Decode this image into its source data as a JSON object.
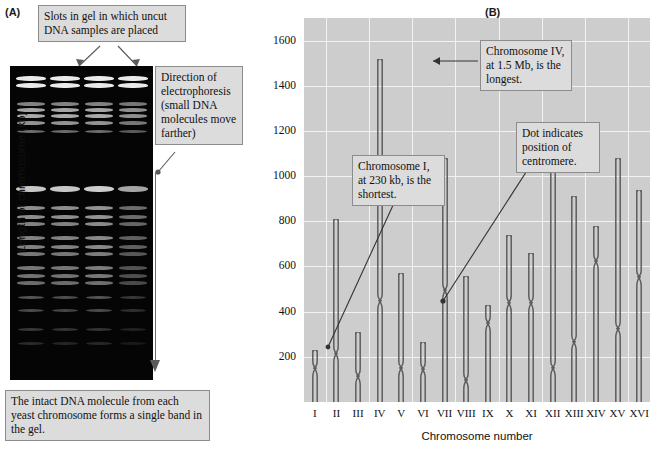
{
  "figure": {
    "panel_a_letter": "(A)",
    "panel_b_letter": "(B)"
  },
  "panel_a": {
    "slots_callout": "Slots in gel in which uncut DNA samples are placed",
    "direction_callout": "Direction of electrophoresis (small DNA molecules move farther)",
    "intact_callout": "The intact DNA molecule from each yeast chromosome forms a single band in the gel.",
    "gel": {
      "lane_count": 4,
      "background_color": "#050505",
      "band_color": "#e9e9e9"
    }
  },
  "panel_b": {
    "chrI_callout": "Chromosome I, at 230 kb, is the shortest.",
    "chrIV_callout": "Chromosome IV, at 1.5 Mb, is the longest.",
    "centromere_callout": "Dot indicates position of centromere."
  },
  "chart_data": {
    "type": "bar",
    "title": "",
    "xlabel": "Chromosome number",
    "ylabel": "Length of chromosome (kb)",
    "ylim": [
      0,
      1700
    ],
    "yticks": [
      200,
      400,
      600,
      800,
      1000,
      1200,
      1400,
      1600
    ],
    "grid": true,
    "legend": "none",
    "categories": [
      "I",
      "II",
      "III",
      "IV",
      "V",
      "VI",
      "VII",
      "VIII",
      "IX",
      "X",
      "XI",
      "XII",
      "XIII",
      "XIV",
      "XV",
      "XVI"
    ],
    "values": [
      230,
      810,
      310,
      1520,
      570,
      265,
      1080,
      560,
      430,
      740,
      660,
      1070,
      910,
      780,
      1080,
      940
    ],
    "centromere_positions": [
      150,
      215,
      115,
      450,
      150,
      145,
      495,
      100,
      350,
      440,
      440,
      150,
      265,
      625,
      325,
      555
    ],
    "annotations": [
      {
        "label": "Chromosome I, at 230 kb, is the shortest.",
        "target": "I"
      },
      {
        "label": "Chromosome IV, at 1.5 Mb, is the longest.",
        "target": "IV"
      },
      {
        "label": "Dot indicates position of centromere.",
        "target": "XI"
      }
    ]
  }
}
